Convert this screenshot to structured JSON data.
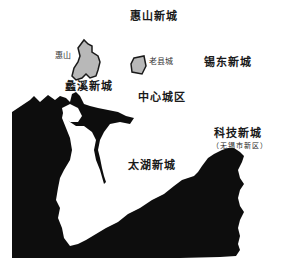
{
  "map": {
    "labels": {
      "huishan_new_city": "惠山新城",
      "huishan": "惠山",
      "old_county_town": "老县城",
      "xidong_new_city": "锡东新城",
      "lixi_new_city": "蠡溪新城",
      "central_district": "中心城区",
      "tech_new_city": "科技新城",
      "tech_new_city_note": "（无锡市新区）",
      "taihu_new_city": "太湖新城"
    },
    "colors": {
      "water": "#0d0d0d",
      "district_fill": "#b8b8b8",
      "district_outline": "#1a1a1a",
      "background": "#ffffff"
    }
  }
}
